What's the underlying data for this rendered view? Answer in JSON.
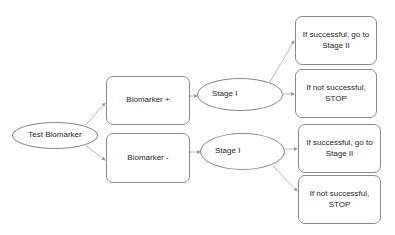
{
  "diagram": {
    "root": {
      "label": "Test Biomarker",
      "shape": "ellipse"
    },
    "branches": [
      {
        "label": "Biomarker +",
        "shape": "rounded-rectangle",
        "stage": {
          "label": "Stage I",
          "shape": "ellipse"
        },
        "outcomes": [
          {
            "label": "If successful, go to Stage II",
            "line1": "If successful, go to",
            "line2": "Stage II"
          },
          {
            "label": "If not successful, STOP",
            "line1": "If not successful,",
            "line2": "STOP"
          }
        ]
      },
      {
        "label": "Biomarker -",
        "shape": "rounded-rectangle",
        "stage": {
          "label": "Stage I",
          "shape": "ellipse"
        },
        "outcomes": [
          {
            "label": "If successful, go to Stage II",
            "line1": "If successful, go to",
            "line2": "Stage II"
          },
          {
            "label": "If not successful, STOP",
            "line1": "If not successful,",
            "line2": "STOP"
          }
        ]
      }
    ],
    "colors": {
      "stroke": "#8a8a8a",
      "text": "#262626",
      "background": "#ffffff"
    }
  }
}
